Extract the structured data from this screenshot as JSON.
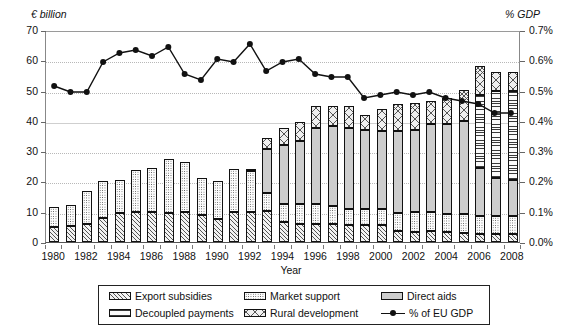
{
  "chart_data": {
    "type": "bar",
    "title": "",
    "xlabel": "Year",
    "ylabel": "€ billion",
    "y2label": "% GDP",
    "ylim": [
      0,
      70
    ],
    "y2lim": [
      0,
      0.7
    ],
    "grid": true,
    "legend_position": "bottom",
    "y_ticks": [
      "0",
      "10",
      "20",
      "30",
      "40",
      "50",
      "60",
      "70"
    ],
    "y2_ticks": [
      "0.0%",
      "0.1%",
      "0.2%",
      "0.3%",
      "0.4%",
      "0.5%",
      "0.6%",
      "0.7%"
    ],
    "categories": [
      1980,
      1981,
      1982,
      1983,
      1984,
      1985,
      1986,
      1987,
      1988,
      1989,
      1990,
      1991,
      1992,
      1993,
      1994,
      1995,
      1996,
      1997,
      1998,
      1999,
      2000,
      2001,
      2002,
      2003,
      2004,
      2005,
      2006,
      2007,
      2008
    ],
    "x_tick_labels": [
      "1980",
      "1982",
      "1984",
      "1986",
      "1988",
      "1990",
      "1992",
      "1994",
      "1996",
      "1998",
      "2000",
      "2002",
      "2004",
      "2006",
      "2008"
    ],
    "series": [
      {
        "name": "Export subsidies",
        "pattern": "diagonal-hatch",
        "values": [
          5.0,
          5.3,
          6.0,
          8.0,
          9.5,
          9.8,
          10.0,
          9.5,
          9.8,
          9.0,
          7.5,
          10.0,
          10.0,
          10.2,
          6.5,
          6.0,
          6.0,
          5.8,
          5.5,
          5.5,
          5.6,
          3.5,
          3.4,
          3.5,
          3.2,
          3.0,
          2.6,
          2.5,
          2.5
        ]
      },
      {
        "name": "Market support",
        "pattern": "fine-dots",
        "values": [
          6.5,
          7.0,
          10.8,
          12.0,
          11.0,
          14.0,
          14.5,
          18.0,
          16.5,
          12.0,
          12.5,
          14.0,
          13.5,
          6.0,
          6.0,
          6.5,
          6.5,
          6.0,
          5.5,
          5.5,
          5.4,
          6.0,
          6.5,
          6.5,
          6.2,
          6.3,
          6.0,
          6.0,
          6.0
        ]
      },
      {
        "name": "Direct aids",
        "pattern": "solid-grey",
        "values": [
          0,
          0,
          0,
          0,
          0,
          0,
          0,
          0,
          0,
          0,
          0,
          0,
          0,
          14.5,
          19.5,
          21.0,
          25.0,
          26.5,
          26.5,
          26.0,
          25.5,
          27.0,
          27.0,
          29.0,
          29.5,
          30.5,
          16.0,
          12.5,
          12.0
        ]
      },
      {
        "name": "Decoupled payments",
        "pattern": "horizontal-lines",
        "values": [
          0,
          0,
          0,
          0,
          0,
          0,
          0,
          0,
          0,
          0,
          0,
          0,
          0,
          0,
          0,
          0,
          0,
          0,
          0,
          0,
          0,
          0,
          0,
          0,
          0,
          0,
          24.0,
          29.0,
          29.5
        ]
      },
      {
        "name": "Rural development",
        "pattern": "cross-hatch",
        "values": [
          0,
          0,
          0,
          0,
          0,
          0,
          0,
          0,
          0,
          0,
          0,
          0,
          0.5,
          3.5,
          5.5,
          6.0,
          7.5,
          6.5,
          7.5,
          5.0,
          7.5,
          9.0,
          9.0,
          7.5,
          8.5,
          10.5,
          9.5,
          6.0,
          6.0
        ]
      },
      {
        "name": "% of EU GDP",
        "type": "line",
        "axis": "y2",
        "marker": "circle",
        "values": [
          0.52,
          0.5,
          0.5,
          0.6,
          0.63,
          0.64,
          0.62,
          0.65,
          0.56,
          0.54,
          0.61,
          0.6,
          0.66,
          0.57,
          0.6,
          0.61,
          0.56,
          0.55,
          0.55,
          0.48,
          0.49,
          0.5,
          0.49,
          0.5,
          0.48,
          0.47,
          0.46,
          0.43,
          0.43
        ]
      }
    ]
  },
  "legend": {
    "items": [
      {
        "label": "Export subsidies",
        "swatch": "p-export"
      },
      {
        "label": "Market support",
        "swatch": "p-market"
      },
      {
        "label": "Direct aids",
        "swatch": "p-direct"
      },
      {
        "label": "Decoupled payments",
        "swatch": "p-decoupled"
      },
      {
        "label": "Rural development",
        "swatch": "p-rural"
      },
      {
        "label": "% of EU GDP",
        "swatch": "line-marker"
      }
    ]
  }
}
